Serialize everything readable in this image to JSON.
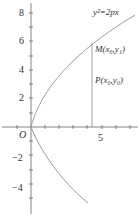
{
  "figure": {
    "type": "parabola-diagram",
    "equation_label": "y²=2px",
    "origin_label": "O",
    "points": [
      {
        "name": "M",
        "label": "M(x₀,y₁)"
      },
      {
        "name": "P",
        "label": "P(x₀,y₀)"
      }
    ],
    "x_ticks": [
      {
        "value": 5,
        "label": "5"
      }
    ],
    "y_ticks": [
      {
        "value": 8,
        "label": "8"
      },
      {
        "value": 6,
        "label": "6"
      },
      {
        "value": 4,
        "label": "4"
      },
      {
        "value": 2,
        "label": "2"
      },
      {
        "value": -2,
        "label": "−2"
      },
      {
        "value": -4,
        "label": "−4"
      }
    ],
    "colors": {
      "axis": "#555555",
      "curve": "#9a9a9a",
      "line": "#888888",
      "text": "#333333"
    }
  }
}
